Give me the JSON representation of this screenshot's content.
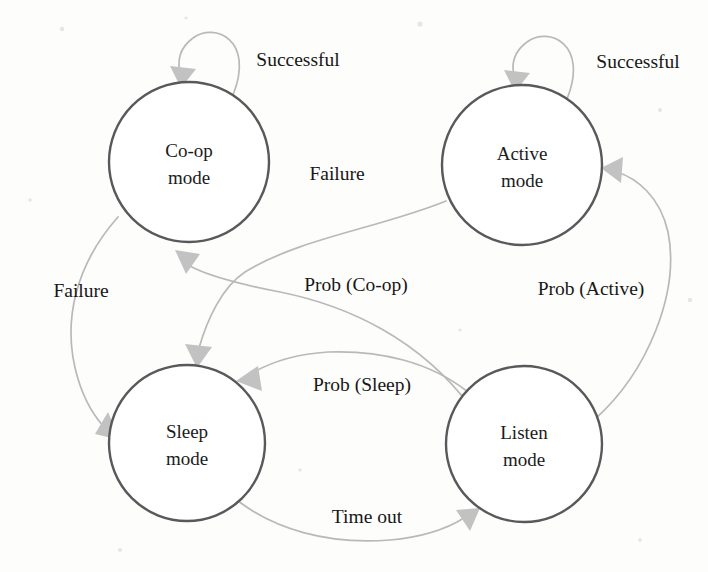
{
  "diagram": {
    "background_color": "#fdfdfc",
    "node_stroke_color": "#59595b",
    "edge_color": "#b9b9b9",
    "text_color": "#1b1b1b",
    "nodes": [
      {
        "id": "coop",
        "label_line1": "Co-op",
        "label_line2": "mode",
        "cx": 189,
        "cy": 162,
        "r": 80
      },
      {
        "id": "active",
        "label_line1": "Active",
        "label_line2": "mode",
        "cx": 522,
        "cy": 165,
        "r": 80
      },
      {
        "id": "sleep",
        "label_line1": "Sleep",
        "label_line2": "mode",
        "cx": 187,
        "cy": 443,
        "r": 78
      },
      {
        "id": "listen",
        "label_line1": "Listen",
        "label_line2": "mode",
        "cx": 524,
        "cy": 444,
        "r": 78
      }
    ],
    "edges": [
      {
        "id": "coop-self",
        "label": "Successful",
        "from": "coop",
        "to": "coop",
        "label_x": 298,
        "label_y": 66
      },
      {
        "id": "active-self",
        "label": "Successful",
        "from": "active",
        "to": "active",
        "label_x": 638,
        "label_y": 68
      },
      {
        "id": "active-to-sleep",
        "label": "Failure",
        "from": "active",
        "to": "sleep",
        "label_x": 337,
        "label_y": 180
      },
      {
        "id": "coop-to-sleep",
        "label": "Failure",
        "from": "coop",
        "to": "sleep",
        "label_x": 81,
        "label_y": 297
      },
      {
        "id": "listen-to-coop",
        "label": "Prob (Co-op)",
        "from": "listen",
        "to": "coop",
        "label_x": 356,
        "label_y": 291
      },
      {
        "id": "listen-to-active",
        "label": "Prob (Active)",
        "from": "listen",
        "to": "active",
        "label_x": 591,
        "label_y": 295
      },
      {
        "id": "listen-to-sleep",
        "label": "Prob (Sleep)",
        "from": "listen",
        "to": "sleep",
        "label_x": 362,
        "label_y": 391
      },
      {
        "id": "sleep-to-listen",
        "label": "Time out",
        "from": "sleep",
        "to": "listen",
        "label_x": 367,
        "label_y": 523
      }
    ]
  }
}
